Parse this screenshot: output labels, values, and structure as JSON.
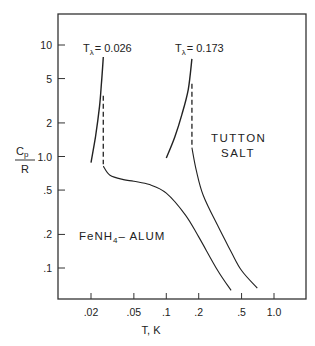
{
  "chart_data": {
    "type": "line",
    "title": "",
    "xlabel": "T,  K",
    "ylabel_num": "Cp",
    "ylabel_den": "R",
    "xscale": "log",
    "yscale": "log",
    "xlim": [
      0.011,
      1.6
    ],
    "ylim": [
      0.063,
      14
    ],
    "grid": false,
    "x_ticks": [
      {
        "value": 0.02,
        "label": ".02"
      },
      {
        "value": 0.05,
        "label": ".05"
      },
      {
        "value": 0.1,
        "label": ".1"
      },
      {
        "value": 0.2,
        "label": ".2"
      },
      {
        "value": 0.5,
        "label": ".5"
      },
      {
        "value": 1.0,
        "label": "1.0"
      }
    ],
    "y_ticks": [
      {
        "value": 10,
        "label": "10"
      },
      {
        "value": 5,
        "label": "5"
      },
      {
        "value": 2,
        "label": "2"
      },
      {
        "value": 1,
        "label": "1.0"
      },
      {
        "value": 0.5,
        "label": ".5"
      },
      {
        "value": 0.2,
        "label": ".2"
      },
      {
        "value": 0.1,
        "label": ".1"
      }
    ],
    "series": [
      {
        "name": "FeNH4-ALUM",
        "transition_label": "Tλ = 0.026",
        "transition_T": 0.026,
        "below_transition": {
          "x": [
            0.02,
            0.022,
            0.024,
            0.025,
            0.026
          ],
          "y": [
            0.88,
            1.5,
            2.8,
            4.5,
            7.8
          ]
        },
        "dashed_drop": {
          "x": [
            0.026,
            0.026
          ],
          "y": [
            3.5,
            0.85
          ]
        },
        "above_transition": {
          "x": [
            0.026,
            0.03,
            0.04,
            0.05,
            0.07,
            0.1,
            0.15,
            0.2,
            0.3,
            0.4
          ],
          "y": [
            0.82,
            0.68,
            0.62,
            0.6,
            0.56,
            0.47,
            0.3,
            0.19,
            0.095,
            0.063
          ]
        }
      },
      {
        "name": "TUTTON SALT",
        "transition_label": "Tλ = 0.173",
        "transition_T": 0.173,
        "below_transition": {
          "x": [
            0.1,
            0.12,
            0.14,
            0.16,
            0.173
          ],
          "y": [
            0.97,
            1.5,
            2.4,
            4.0,
            7.5
          ]
        },
        "dashed_drop": {
          "x": [
            0.173,
            0.173
          ],
          "y": [
            4.5,
            1.25
          ]
        },
        "above_transition": {
          "x": [
            0.173,
            0.19,
            0.22,
            0.3,
            0.4,
            0.5,
            0.7
          ],
          "y": [
            1.2,
            0.75,
            0.45,
            0.24,
            0.14,
            0.095,
            0.066
          ]
        }
      }
    ],
    "annotations": [
      {
        "text": "TUTTON",
        "x": 0.21,
        "y": 1.45
      },
      {
        "text": "SALT",
        "x": 0.23,
        "y": 1.05
      },
      {
        "text": "FeNH4– ALUM",
        "x": 0.018,
        "y": 0.22
      }
    ]
  },
  "labels": {
    "tl1_T": "T",
    "tl1_sub": "λ",
    "tl1_val": "= 0.026",
    "tl2_T": "T",
    "tl2_sub": "λ",
    "tl2_val": "= 0.173",
    "tutton": "TUTTON",
    "salt": "SALT",
    "alum_pre": "FeNH",
    "alum_sub": "4",
    "alum_post": "– ALUM",
    "x_axis": "T,  K",
    "y_num": "C",
    "y_num_sub": "p",
    "y_den": "R"
  }
}
